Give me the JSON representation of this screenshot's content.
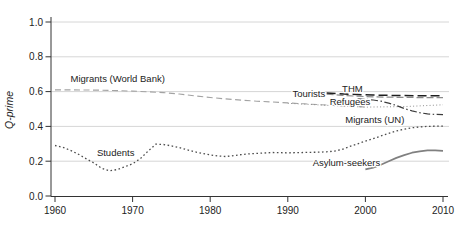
{
  "chart_data": {
    "type": "line",
    "title": "",
    "xlabel": "",
    "ylabel": "Q-prime",
    "xlim": [
      1960,
      2010
    ],
    "ylim": [
      0.0,
      1.0
    ],
    "xticks": [
      1960,
      1970,
      1980,
      1990,
      2000,
      2010
    ],
    "yticks": [
      0.0,
      0.2,
      0.4,
      0.6,
      0.8,
      1.0
    ],
    "ytick_labels": [
      "0.0",
      "0.2",
      "0.4",
      "0.6",
      "0.8",
      "1.0"
    ],
    "grid": "horizontal",
    "legend": "inline-labels",
    "axis_color": "#333333",
    "grid_color": "#d6d6d6",
    "series": [
      {
        "name": "migrants-world-bank",
        "label": "Migrants (World Bank)",
        "color": "#a3a3a3",
        "dash": "6,3.5",
        "width": 1.1,
        "label_anchor": {
          "year": 1962.0,
          "value": 0.67
        },
        "points": [
          [
            1960,
            0.61
          ],
          [
            1962,
            0.61
          ],
          [
            1964,
            0.609
          ],
          [
            1966,
            0.608
          ],
          [
            1968,
            0.606
          ],
          [
            1970,
            0.603
          ],
          [
            1972,
            0.599
          ],
          [
            1974,
            0.594
          ],
          [
            1976,
            0.586
          ],
          [
            1978,
            0.576
          ],
          [
            1980,
            0.566
          ],
          [
            1982,
            0.558
          ],
          [
            1984,
            0.551
          ],
          [
            1986,
            0.545
          ],
          [
            1988,
            0.54
          ],
          [
            1990,
            0.535
          ],
          [
            1992,
            0.53
          ],
          [
            1994,
            0.525
          ],
          [
            1996,
            0.52
          ],
          [
            1998,
            0.516
          ],
          [
            2000,
            0.512
          ]
        ]
      },
      {
        "name": "migrants-un",
        "label": "Migrants (UN)",
        "color": "#8f8f8f",
        "dash": "1,2.3",
        "width": 1.0,
        "label_anchor": {
          "year": 1997.4,
          "value": 0.437
        },
        "points": [
          [
            1990,
            0.533
          ],
          [
            1995,
            0.521
          ],
          [
            2000,
            0.511
          ],
          [
            2005,
            0.514
          ],
          [
            2010,
            0.524
          ]
        ]
      },
      {
        "name": "tourists",
        "label": "Tourists",
        "color": "#8c8c8c",
        "dash": "7,3",
        "width": 1.2,
        "label_anchor": {
          "year": 1990.6,
          "value": 0.585
        },
        "points": [
          [
            1995,
            0.585
          ],
          [
            1997,
            0.578
          ],
          [
            2000,
            0.571
          ],
          [
            2003,
            0.568
          ],
          [
            2006,
            0.566
          ],
          [
            2010,
            0.565
          ]
        ]
      },
      {
        "name": "thm",
        "label": "THM",
        "color": "#1f1f1f",
        "dash": "9,4",
        "width": 1.5,
        "label_anchor": {
          "year": 1997.0,
          "value": 0.615
        },
        "points": [
          [
            1995,
            0.592
          ],
          [
            1998,
            0.585
          ],
          [
            2001,
            0.58
          ],
          [
            2005,
            0.577
          ],
          [
            2010,
            0.576
          ]
        ]
      },
      {
        "name": "refugees",
        "label": "Refugees",
        "color": "#3d3d3d",
        "dash": "7,2.5,1.5,2.5",
        "width": 1.2,
        "label_anchor": {
          "year": 1995.4,
          "value": 0.54
        },
        "points": [
          [
            1999,
            0.558
          ],
          [
            2000,
            0.556
          ],
          [
            2001,
            0.552
          ],
          [
            2002,
            0.545
          ],
          [
            2003,
            0.534
          ],
          [
            2004,
            0.52
          ],
          [
            2005,
            0.503
          ],
          [
            2006,
            0.489
          ],
          [
            2007,
            0.479
          ],
          [
            2008,
            0.472
          ],
          [
            2009,
            0.469
          ],
          [
            2010,
            0.468
          ]
        ]
      },
      {
        "name": "students",
        "label": "Students",
        "color": "#4d4d4d",
        "dash": "1.6,2.5",
        "width": 1.3,
        "label_anchor": {
          "year": 1965.4,
          "value": 0.25
        },
        "points": [
          [
            1960,
            0.29
          ],
          [
            1961,
            0.28
          ],
          [
            1962,
            0.262
          ],
          [
            1963,
            0.24
          ],
          [
            1964,
            0.215
          ],
          [
            1965,
            0.19
          ],
          [
            1966,
            0.16
          ],
          [
            1967,
            0.145
          ],
          [
            1968,
            0.152
          ],
          [
            1969,
            0.168
          ],
          [
            1970,
            0.185
          ],
          [
            1971,
            0.215
          ],
          [
            1972,
            0.258
          ],
          [
            1973,
            0.298
          ],
          [
            1974,
            0.296
          ],
          [
            1975,
            0.288
          ],
          [
            1976,
            0.278
          ],
          [
            1977,
            0.266
          ],
          [
            1978,
            0.254
          ],
          [
            1979,
            0.244
          ],
          [
            1980,
            0.236
          ],
          [
            1981,
            0.23
          ],
          [
            1982,
            0.227
          ],
          [
            1983,
            0.232
          ],
          [
            1984,
            0.238
          ],
          [
            1985,
            0.242
          ],
          [
            1986,
            0.245
          ],
          [
            1987,
            0.247
          ],
          [
            1988,
            0.25
          ],
          [
            1989,
            0.249
          ],
          [
            1990,
            0.248
          ],
          [
            1991,
            0.249
          ],
          [
            1992,
            0.25
          ],
          [
            1993,
            0.251
          ],
          [
            1994,
            0.252
          ],
          [
            1995,
            0.254
          ],
          [
            1996,
            0.258
          ],
          [
            1997,
            0.268
          ],
          [
            1998,
            0.285
          ],
          [
            1999,
            0.3
          ],
          [
            2000,
            0.315
          ],
          [
            2001,
            0.33
          ],
          [
            2002,
            0.345
          ],
          [
            2003,
            0.36
          ],
          [
            2004,
            0.374
          ],
          [
            2005,
            0.384
          ],
          [
            2006,
            0.392
          ],
          [
            2007,
            0.397
          ],
          [
            2008,
            0.4
          ],
          [
            2009,
            0.401
          ],
          [
            2010,
            0.401
          ]
        ]
      },
      {
        "name": "asylum-seekers",
        "label": "Asylum-seekers",
        "color": "#808080",
        "dash": "",
        "width": 1.7,
        "label_anchor": {
          "year": 1993.2,
          "value": 0.19
        },
        "points": [
          [
            2000,
            0.153
          ],
          [
            2001,
            0.163
          ],
          [
            2002,
            0.18
          ],
          [
            2003,
            0.2
          ],
          [
            2004,
            0.219
          ],
          [
            2005,
            0.235
          ],
          [
            2006,
            0.249
          ],
          [
            2007,
            0.257
          ],
          [
            2008,
            0.262
          ],
          [
            2009,
            0.262
          ],
          [
            2010,
            0.26
          ]
        ]
      }
    ]
  }
}
